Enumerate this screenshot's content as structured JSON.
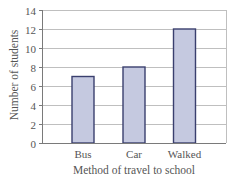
{
  "chart_data": {
    "type": "bar",
    "title": "",
    "xlabel": "Method of travel to school",
    "ylabel": "Number of students",
    "categories": [
      "Bus",
      "Car",
      "Walked"
    ],
    "values": [
      7,
      8,
      12
    ],
    "ylim": [
      0,
      14
    ],
    "yticks": [
      0,
      2,
      4,
      6,
      8,
      10,
      12,
      14
    ],
    "grid": true,
    "legend": null
  },
  "colors": {
    "bar_fill": "#c5c9e0",
    "bar_stroke": "#3a3f6e",
    "grid": "#bfbfbf",
    "axis": "#7a7a7a",
    "text": "#555555"
  }
}
